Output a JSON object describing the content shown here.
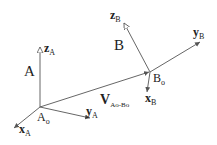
{
  "diagram": {
    "type": "coordinate-frames",
    "frames": [
      {
        "name": "A",
        "label": "A",
        "origin": {
          "label": "A",
          "sub": "o",
          "x": 40,
          "y": 107
        },
        "axes": [
          {
            "name": "z",
            "label": "z",
            "sub": "A",
            "to": {
              "x": 40,
              "y": 46
            }
          },
          {
            "name": "x",
            "label": "x",
            "sub": "A",
            "to": {
              "x": 14,
              "y": 128
            }
          },
          {
            "name": "y",
            "label": "y",
            "sub": "A",
            "to": {
              "x": 90,
              "y": 118
            }
          }
        ]
      },
      {
        "name": "B",
        "label": "B",
        "origin": {
          "label": "B",
          "sub": "o",
          "x": 150,
          "y": 72
        },
        "axes": [
          {
            "name": "z",
            "label": "z",
            "sub": "B",
            "to": {
              "x": 123,
              "y": 22
            }
          },
          {
            "name": "y",
            "label": "y",
            "sub": "B",
            "to": {
              "x": 200,
              "y": 42
            }
          },
          {
            "name": "x",
            "label": "x",
            "sub": "B",
            "to": {
              "x": 147,
              "y": 92
            }
          }
        ]
      }
    ],
    "vector": {
      "label": "V",
      "sub": "Ao-Bo",
      "from": "A_o",
      "to": "B_o"
    },
    "line_color": "#555555",
    "text_color": "#222222"
  }
}
